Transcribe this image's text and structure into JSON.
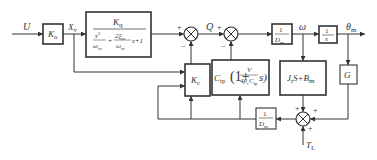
{
  "diagram": {
    "signals": {
      "input": "U",
      "valve_disp": "X",
      "valve_disp_sub": "v",
      "flow": "Q",
      "speed": "ω",
      "angle": "θ",
      "angle_sub": "m",
      "load_torque": "T",
      "load_torque_sub": "L"
    },
    "blocks": {
      "ka": {
        "main": "K",
        "sub": "a"
      },
      "servo_valve": {
        "num": "K",
        "num_sub": "q",
        "den_s2": "s",
        "den_s2_sup": "2",
        "den_w": "ω",
        "den_w_sub": "sv",
        "den_w_sup": "2",
        "plus": "+",
        "den_2xi": "2ξ",
        "den_2xi_sub": "sv",
        "den_w2": "ω",
        "den_w2_sub": "sv",
        "tail": "s+1"
      },
      "kc": {
        "main": "K",
        "sub": "c"
      },
      "ctp": {
        "c": "C",
        "c_sub": "tp",
        "open": "(1+",
        "num": "V",
        "den": "4β",
        "den_sub": "e",
        "den_c": "C",
        "den_c_sub": "tp",
        "close": "s)"
      },
      "inv_dm": {
        "num": "1",
        "den": "D",
        "den_sub": "m"
      },
      "integrator": {
        "num": "1",
        "den": "s"
      },
      "inertia": {
        "j": "J",
        "j_sub": "t",
        "mid": "S+",
        "b": "B",
        "b_sub": "m"
      },
      "g": {
        "main": "G"
      },
      "inv_dm_fb": {
        "num": "1",
        "den": "D",
        "den_sub": "m"
      }
    },
    "signs": {
      "sum1_plus": "+",
      "sum1_minus": "−",
      "sum2_plus": "+",
      "sum2_minus": "−",
      "sum3_top": "+",
      "sum3_right": "+",
      "sum3_bottom": "+"
    }
  }
}
